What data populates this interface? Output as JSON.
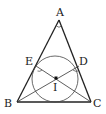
{
  "diagram": {
    "type": "geometry",
    "points": {
      "A": {
        "label": "A",
        "x": 59,
        "y": 20
      },
      "B": {
        "label": "B",
        "x": 17,
        "y": 102
      },
      "C": {
        "label": "C",
        "x": 91,
        "y": 102
      },
      "D": {
        "label": "D",
        "x": 79,
        "y": 66
      },
      "E": {
        "label": "E",
        "x": 36,
        "y": 66
      },
      "I": {
        "label": "I",
        "x": 56,
        "y": 78
      }
    },
    "segments": [
      "AB",
      "AC",
      "BC",
      "BD",
      "CE"
    ],
    "circle": {
      "cx": 55,
      "cy": 79,
      "r": 23
    },
    "angle_marks": [
      "A",
      "E",
      "D"
    ],
    "colors": {
      "stroke": "#222222",
      "background": "#ffffff"
    }
  }
}
